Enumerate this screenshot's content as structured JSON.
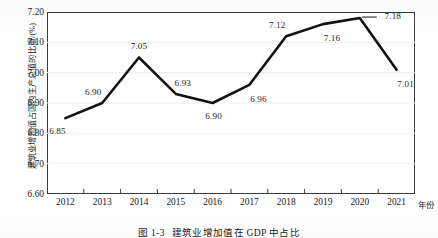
{
  "figure": {
    "caption_number": "图 1-3",
    "caption_text": "建筑业增加值在 GDP 中占比"
  },
  "axes": {
    "y_title": "建筑业增加值占国内生产总值的比重/(%)",
    "x_unit_label": "年份"
  },
  "colors": {
    "line": "#121212",
    "frame": "#3a3a3a",
    "grid": "#ededed",
    "text": "#1f1f1f",
    "background": "#ffffff"
  },
  "chart_data": {
    "type": "line",
    "xlabel": "年份",
    "ylabel": "建筑业增加值占国内生产总值的比重/(%)",
    "categories": [
      "2012",
      "2013",
      "2014",
      "2015",
      "2016",
      "2017",
      "2018",
      "2019",
      "2020",
      "2021"
    ],
    "values": [
      6.85,
      6.9,
      7.05,
      6.93,
      6.9,
      6.96,
      7.12,
      7.16,
      7.18,
      7.01
    ],
    "point_labels": [
      "6.85",
      "6.90",
      "7.05",
      "6.93",
      "6.90",
      "6.96",
      "7.12",
      "7.16",
      "7.18",
      "7.01"
    ],
    "label_positions": [
      "below-left",
      "above-left",
      "above",
      "above-right",
      "below",
      "below-right",
      "above-left",
      "below-right",
      "right-leader",
      "below-right"
    ],
    "ylim": [
      6.6,
      7.2
    ],
    "yticks": [
      "6.60",
      "6.70",
      "6.80",
      "6.90",
      "7.00",
      "7.10",
      "7.20"
    ],
    "ytick_values": [
      6.6,
      6.7,
      6.8,
      6.9,
      7.0,
      7.1,
      7.2
    ],
    "grid": "horizontal-faint",
    "legend": "none",
    "marker": "none",
    "line_width": 2.6
  }
}
